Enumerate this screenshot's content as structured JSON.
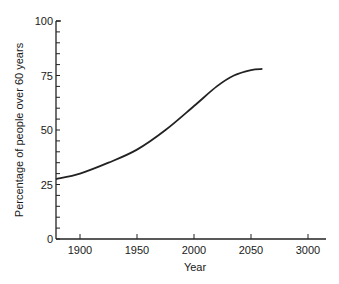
{
  "chart_data": {
    "type": "line",
    "title": "",
    "xlabel": "Year",
    "ylabel": "Percentage of people over 60 years",
    "x_tick_labels": [
      "1900",
      "1950",
      "2000",
      "2050",
      "3000"
    ],
    "y_tick_labels": [
      "0",
      "25",
      "50",
      "75",
      "100"
    ],
    "ylim": [
      0,
      100
    ],
    "xlim": [
      1880,
      2150
    ],
    "grid": false,
    "legend": null,
    "series": [
      {
        "name": "Percentage of people over 60 years",
        "x": [
          1880,
          1900,
          1925,
          1950,
          1975,
          2000,
          2020,
          2035,
          2050,
          2060
        ],
        "values": [
          27.5,
          30,
          35,
          41,
          50,
          61,
          70,
          75,
          77.5,
          78
        ]
      }
    ]
  },
  "colors": {
    "line": "#222222",
    "axis": "#222222",
    "background": "#ffffff"
  }
}
